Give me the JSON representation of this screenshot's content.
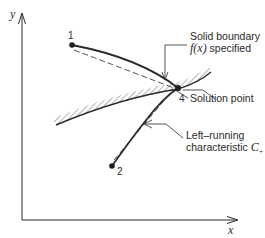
{
  "axes": {
    "x_label": "x",
    "y_label": "y"
  },
  "points": [
    {
      "id": "1",
      "label": "1"
    },
    {
      "id": "2",
      "label": "2"
    },
    {
      "id": "4",
      "label": "4"
    }
  ],
  "annotations": {
    "boundary_line1": "Solid boundary",
    "boundary_line2_fx": "f(x)",
    "boundary_line2_rest": " specified",
    "solution_point": "Solution point",
    "characteristic_line1": "Left–running",
    "characteristic_line2": "characteristic ",
    "characteristic_symbol": "C",
    "characteristic_subscript": "+"
  },
  "colors": {
    "ink": "#2a2a2a",
    "background": "#ffffff"
  }
}
